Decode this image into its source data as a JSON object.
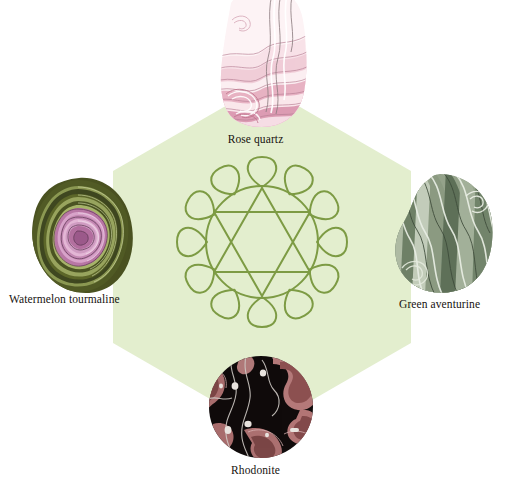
{
  "diagram": {
    "background_color": "#ffffff",
    "hexagon": {
      "name": "hexagon-backdrop",
      "fill_color": "#e3eece",
      "center_x": 262,
      "center_y": 257,
      "radius": 172
    },
    "center_symbol": {
      "name": "anahata-chakra-symbol",
      "description": "Anahata heart chakra lotus with twelve petals, circle and interlocking Star of David hexagram",
      "stroke_color": "#7d9b44",
      "petal_count": 12,
      "center_x": 262,
      "center_y": 242,
      "outer_radius": 76
    },
    "stones": [
      {
        "id": "rose-quartz",
        "label": "Rose quartz",
        "position": "top",
        "shape": "irregular-blob",
        "colors": {
          "base": "#fdf2f4",
          "band_light": "#f7dde4",
          "band_mid": "#e8afc0",
          "band_deep": "#d58da6",
          "outline": "#6f5a5e"
        }
      },
      {
        "id": "watermelon-tourmaline",
        "label": "Watermelon tourmaline",
        "position": "left",
        "shape": "rounded-blob",
        "colors": {
          "base": "#4b5321",
          "band_light": "#8d9a54",
          "band_mid": "#3e4520",
          "core_pink": "#c27cae",
          "core_light": "#e0aed0",
          "core_deep": "#7e3564"
        }
      },
      {
        "id": "green-aventurine",
        "label": "Green aventurine",
        "position": "right",
        "shape": "rounded-blob",
        "colors": {
          "base": "#93a389",
          "band_light": "#ccd6c4",
          "band_mid": "#7b8a74",
          "band_deep": "#5c6a57",
          "outline": "#3c4739"
        }
      },
      {
        "id": "rhodonite",
        "label": "Rhodonite",
        "position": "bottom",
        "shape": "circle",
        "colors": {
          "base": "#120d0d",
          "band_light": "#c99090",
          "band_mid": "#a86a6a",
          "band_deep": "#7d4444",
          "speck": "#e7e2dd"
        }
      }
    ]
  }
}
